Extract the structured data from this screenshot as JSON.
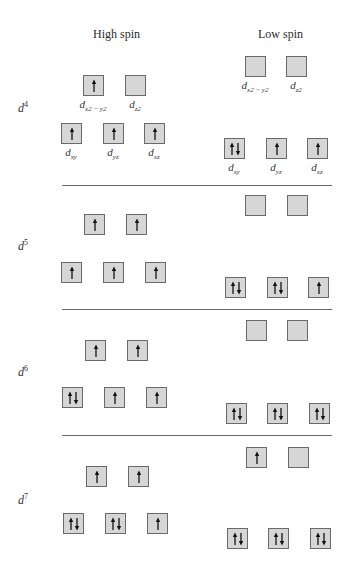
{
  "headers": {
    "high": "High spin",
    "low": "Low spin"
  },
  "orbital_labels": {
    "dx2y2": {
      "base": "d",
      "sub": "x2 − y2"
    },
    "dz2": {
      "base": "d",
      "sub": "z2"
    },
    "dxy": {
      "base": "d",
      "sub": "xy"
    },
    "dyz": {
      "base": "d",
      "sub": "yz"
    },
    "dxz": {
      "base": "d",
      "sub": "xz"
    }
  },
  "colors": {
    "box_fill": "#d6d6d6",
    "box_border": "#6a6a6a",
    "arrow": "#111111",
    "divider": "#6a6a6a"
  },
  "configurations": [
    {
      "name": "d",
      "electrons": "4",
      "high": {
        "eg": [
          "up",
          "empty"
        ],
        "t2g": [
          "up",
          "up",
          "up"
        ]
      },
      "low": {
        "eg": [
          "empty",
          "empty"
        ],
        "t2g": [
          "pair",
          "up",
          "up"
        ]
      }
    },
    {
      "name": "d",
      "electrons": "5",
      "high": {
        "eg": [
          "up",
          "up"
        ],
        "t2g": [
          "up",
          "up",
          "up"
        ]
      },
      "low": {
        "eg": [
          "empty",
          "empty"
        ],
        "t2g": [
          "pair",
          "pair",
          "up"
        ]
      }
    },
    {
      "name": "d",
      "electrons": "6",
      "high": {
        "eg": [
          "up",
          "up"
        ],
        "t2g": [
          "pair",
          "up",
          "up"
        ]
      },
      "low": {
        "eg": [
          "empty",
          "empty"
        ],
        "t2g": [
          "pair",
          "pair",
          "pair"
        ]
      }
    },
    {
      "name": "d",
      "electrons": "7",
      "high": {
        "eg": [
          "up",
          "up"
        ],
        "t2g": [
          "pair",
          "pair",
          "up"
        ]
      },
      "low": {
        "eg": [
          "up",
          "empty"
        ],
        "t2g": [
          "pair",
          "pair",
          "pair"
        ]
      }
    }
  ]
}
